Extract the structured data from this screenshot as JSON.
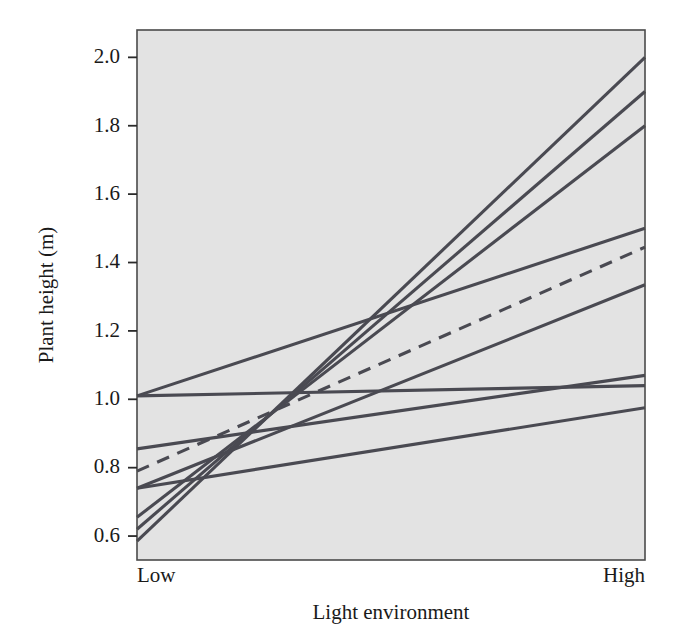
{
  "chart_data": {
    "type": "line",
    "title": "",
    "subtitle": "",
    "xlabel": "Light environment",
    "ylabel": "Plant height (m)",
    "x": [
      "Low",
      "High"
    ],
    "xticklabels": [
      "Low",
      "High"
    ],
    "yticklabels": [
      "0.6",
      "0.8",
      "1.0",
      "1.2",
      "1.4",
      "1.6",
      "1.8",
      "2.0"
    ],
    "yticks": [
      0.6,
      0.8,
      1.0,
      1.2,
      1.4,
      1.6,
      1.8,
      2.0
    ],
    "ylim": [
      0.53,
      2.08
    ],
    "xlim": [
      0,
      1
    ],
    "grid": false,
    "legend": false,
    "legend_position": "none",
    "panel_background": "#e3e3e3",
    "line_color": "#4a4a52",
    "annotations": [],
    "series": [
      {
        "name": "genotype-1",
        "values": [
          0.585,
          2.0
        ],
        "style": "solid"
      },
      {
        "name": "genotype-2",
        "values": [
          0.62,
          1.9
        ],
        "style": "solid"
      },
      {
        "name": "genotype-3",
        "values": [
          0.655,
          1.8
        ],
        "style": "solid"
      },
      {
        "name": "genotype-4",
        "values": [
          1.01,
          1.5
        ],
        "style": "solid"
      },
      {
        "name": "genotype-5",
        "values": [
          0.79,
          1.445
        ],
        "style": "dashed"
      },
      {
        "name": "genotype-6",
        "values": [
          0.74,
          1.335
        ],
        "style": "solid"
      },
      {
        "name": "genotype-7",
        "values": [
          0.855,
          1.07
        ],
        "style": "solid"
      },
      {
        "name": "genotype-8",
        "values": [
          1.01,
          1.04
        ],
        "style": "solid"
      },
      {
        "name": "genotype-9",
        "values": [
          0.74,
          0.975
        ],
        "style": "solid"
      }
    ]
  },
  "figure": {
    "xlabel": "Light environment",
    "ylabel": "Plant height (m)",
    "xtick_low": "Low",
    "xtick_high": "High"
  }
}
